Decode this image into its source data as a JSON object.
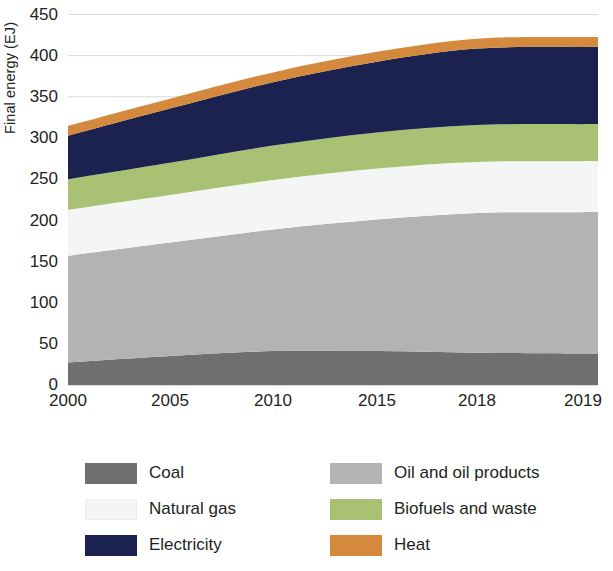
{
  "chart_data": {
    "type": "area",
    "stacked": true,
    "title": "",
    "subtitle": "",
    "xlabel": "",
    "ylabel": "Final energy (EJ)",
    "x": [
      2000,
      2005,
      2010,
      2015,
      2018,
      2019
    ],
    "tick_labels_x": [
      "2000",
      "2005",
      "2010",
      "2015",
      "2018",
      "2019"
    ],
    "tick_labels_y": [
      "0",
      "50",
      "100",
      "150",
      "200",
      "250",
      "300",
      "350",
      "400",
      "450"
    ],
    "ylim": [
      0,
      450
    ],
    "ytick_step": 50,
    "grid": "horizontal",
    "legend_position": "bottom",
    "series": [
      {
        "name": "Coal",
        "color": "#6e6f71",
        "values": [
          26,
          34,
          40,
          40,
          38,
          37
        ]
      },
      {
        "name": "Oil and oil products",
        "color": "#b3b3b3",
        "values": [
          130,
          138,
          148,
          160,
          170,
          172
        ]
      },
      {
        "name": "Natural gas",
        "color": "#f4f6f5",
        "values": [
          56,
          58,
          60,
          62,
          62,
          62
        ]
      },
      {
        "name": "Biofuels and waste",
        "color": "#a8c173",
        "values": [
          37,
          39,
          42,
          44,
          45,
          45
        ]
      },
      {
        "name": "Electricity",
        "color": "#1b2250",
        "values": [
          53,
          66,
          77,
          86,
          93,
          94
        ]
      },
      {
        "name": "Heat",
        "color": "#d4893c",
        "values": [
          12,
          12,
          12,
          12,
          12,
          12
        ]
      }
    ],
    "totals": [
      314,
      347,
      379,
      404,
      420,
      422
    ]
  },
  "legend": {
    "entries": [
      {
        "label": "Coal",
        "color": "#6e6f71",
        "pale": false
      },
      {
        "label": "Oil and oil products",
        "color": "#b3b3b3",
        "pale": false
      },
      {
        "label": "Natural gas",
        "color": "#f4f6f5",
        "pale": true
      },
      {
        "label": "Biofuels and waste",
        "color": "#a8c173",
        "pale": false
      },
      {
        "label": "Electricity",
        "color": "#1b2250",
        "pale": false
      },
      {
        "label": "Heat",
        "color": "#d4893c",
        "pale": false
      }
    ]
  },
  "axes": {
    "y_title": "Final energy (EJ)",
    "gridline_color": "#d9d9d9",
    "axis_color": "#6e6f71",
    "text_color": "#231f20"
  }
}
